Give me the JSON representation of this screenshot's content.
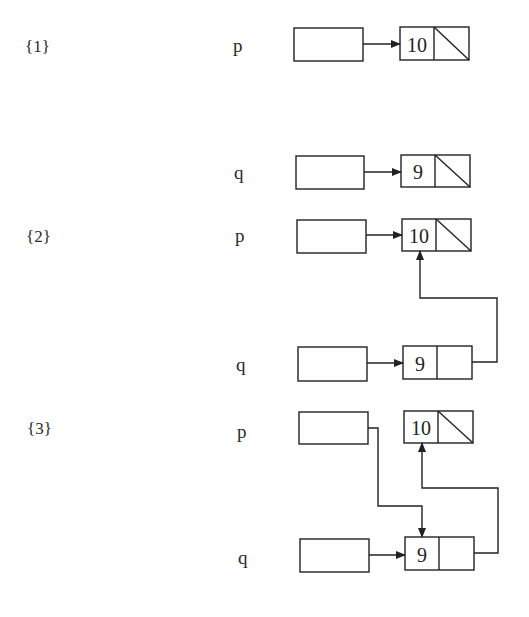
{
  "diagram": {
    "stroke_color": "#222222",
    "background": "#ffffff",
    "steps": [
      {
        "label": "{1}",
        "label_pos": [
          25,
          38
        ],
        "pointers": [
          {
            "name": "p",
            "label_pos": [
              233,
              36
            ],
            "box": [
              294,
              28,
              69,
              33
            ]
          },
          {
            "name": "q",
            "label_pos": [
              234,
              163
            ],
            "box": [
              296,
              156,
              68,
              33
            ]
          }
        ],
        "nodes": [
          {
            "id": "s1-n10",
            "value": "10",
            "rect": [
              400,
              27,
              69,
              33
            ],
            "divider_x": 434,
            "next": "null"
          },
          {
            "id": "s1-n9",
            "value": "9",
            "rect": [
              401,
              155,
              69,
              32
            ],
            "divider_x": 435,
            "next": "null"
          }
        ],
        "edges": [
          {
            "from": "p",
            "to": "s1-n10",
            "points": [
              [
                363,
                44
              ],
              [
                400,
                44
              ]
            ]
          },
          {
            "from": "q",
            "to": "s1-n9",
            "points": [
              [
                364,
                172
              ],
              [
                401,
                172
              ]
            ]
          }
        ]
      },
      {
        "label": "{2}",
        "label_pos": [
          26,
          228
        ],
        "pointers": [
          {
            "name": "p",
            "label_pos": [
              235,
              226
            ],
            "box": [
              297,
              220,
              69,
              33
            ]
          },
          {
            "name": "q",
            "label_pos": [
              236,
              355
            ],
            "box": [
              298,
              347,
              69,
              34
            ]
          }
        ],
        "nodes": [
          {
            "id": "s2-n10",
            "value": "10",
            "rect": [
              402,
              219,
              69,
              32
            ],
            "divider_x": 436,
            "next": "null"
          },
          {
            "id": "s2-n9",
            "value": "9",
            "rect": [
              403,
              346,
              69,
              33
            ],
            "divider_x": 437,
            "next": "s2-n10"
          }
        ],
        "edges": [
          {
            "from": "p",
            "to": "s2-n10",
            "points": [
              [
                366,
                235
              ],
              [
                402,
                235
              ]
            ]
          },
          {
            "from": "q",
            "to": "s2-n9",
            "points": [
              [
                367,
                363
              ],
              [
                403,
                363
              ]
            ]
          },
          {
            "from": "s2-n9.next",
            "to": "s2-n10",
            "points": [
              [
                472,
                362
              ],
              [
                497,
                362
              ],
              [
                497,
                298
              ],
              [
                420,
                298
              ],
              [
                420,
                251
              ]
            ]
          }
        ]
      },
      {
        "label": "{3}",
        "label_pos": [
          27,
          420
        ],
        "pointers": [
          {
            "name": "p",
            "label_pos": [
              237,
              422
            ],
            "box": [
              299,
              412,
              69,
              32
            ]
          },
          {
            "name": "q",
            "label_pos": [
              238,
              548
            ],
            "box": [
              300,
              539,
              69,
              33
            ]
          }
        ],
        "nodes": [
          {
            "id": "s3-n10",
            "value": "10",
            "rect": [
              404,
              411,
              69,
              32
            ],
            "divider_x": 438,
            "next": "null"
          },
          {
            "id": "s3-n9",
            "value": "9",
            "rect": [
              405,
              537,
              69,
              33
            ],
            "divider_x": 439,
            "next": "s3-n10"
          }
        ],
        "edges": [
          {
            "from": "p",
            "to": "s3-n9",
            "points": [
              [
                368,
                428
              ],
              [
                378,
                428
              ],
              [
                378,
                506
              ],
              [
                422,
                506
              ],
              [
                422,
                537
              ]
            ]
          },
          {
            "from": "q",
            "to": "s3-n9",
            "points": [
              [
                369,
                555
              ],
              [
                405,
                555
              ]
            ]
          },
          {
            "from": "s3-n9.next",
            "to": "s3-n10",
            "points": [
              [
                474,
                553
              ],
              [
                498,
                553
              ],
              [
                498,
                488
              ],
              [
                422,
                488
              ],
              [
                422,
                443
              ]
            ]
          }
        ]
      }
    ]
  }
}
